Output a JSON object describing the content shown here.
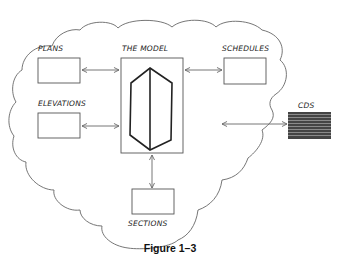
{
  "diagram": {
    "center": {
      "label": "THE MODEL"
    },
    "nodes": [
      {
        "id": "plans",
        "label": "PLANS"
      },
      {
        "id": "elevations",
        "label": "ELEVATIONS"
      },
      {
        "id": "schedules",
        "label": "SCHEDULES"
      },
      {
        "id": "sections",
        "label": "SECTIONS"
      },
      {
        "id": "cds",
        "label": "CDS"
      }
    ],
    "edges": [
      {
        "from": "plans",
        "to": "model",
        "type": "bidirectional"
      },
      {
        "from": "elevations",
        "to": "model",
        "type": "bidirectional"
      },
      {
        "from": "schedules",
        "to": "model",
        "type": "bidirectional"
      },
      {
        "from": "sections",
        "to": "model",
        "type": "bidirectional"
      },
      {
        "from": "cds",
        "to": "cloud",
        "type": "bidirectional"
      }
    ],
    "caption": "Figure 1–3",
    "colors": {
      "line": "#555555",
      "dark": "#222222",
      "stack": "#444444"
    }
  }
}
